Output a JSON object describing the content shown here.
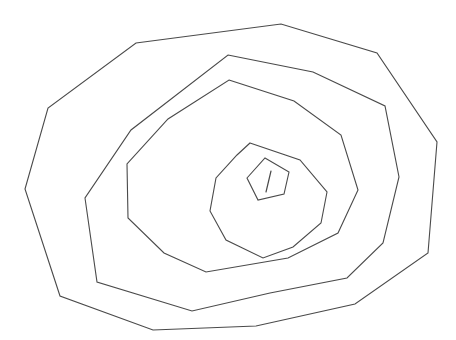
{
  "document": {
    "title": "Nested Polygons Line Drawing",
    "kind": "line-art",
    "description": "Hand-drawn concentric irregular polygons resembling a spiral rose outline",
    "width": 456,
    "height": 340
  },
  "canvas": {
    "background_color": "#ffffff",
    "stroke_color": "#4a4a4a",
    "stroke_width": 1.1
  },
  "shapes": [
    {
      "name": "outer-polygon-ring-1",
      "closed": true,
      "points": "136,43 281,24 377,53 437,142 428,253 355,304 256,326 153,330 60,296 25,189 48,108"
    },
    {
      "name": "polygon-ring-2",
      "closed": true,
      "points": "228,55 313,72 385,106 399,177 383,243 347,278 270,293 192,311 97,282 85,198 131,130"
    },
    {
      "name": "polygon-ring-3",
      "closed": true,
      "points": "229,80 294,101 341,135 358,190 338,233 288,258 206,272 164,253 128,218 127,164 168,119"
    },
    {
      "name": "polygon-ring-4",
      "closed": true,
      "points": "250,143 300,160 327,192 321,223 293,247 263,258 226,240 210,211 216,178 237,155"
    },
    {
      "name": "inner-pentagon-ring-5",
      "closed": true,
      "points": "265,158 289,172 284,194 258,200 247,178"
    }
  ],
  "tail": {
    "name": "inner-tick-mark",
    "points": "271,171 266,192"
  }
}
